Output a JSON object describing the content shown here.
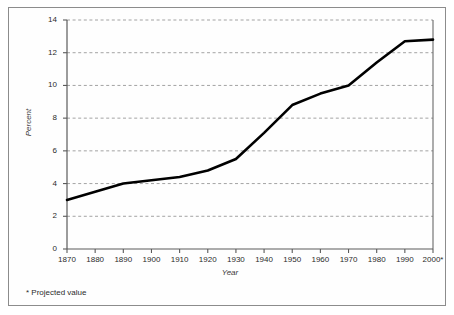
{
  "figure": {
    "footnote": "* Projected value"
  },
  "chart_data": {
    "type": "line",
    "title": "",
    "subtitle": "",
    "xlabel": "Year",
    "ylabel": "Percent",
    "xlim": [
      1870,
      2000
    ],
    "ylim": [
      0,
      14
    ],
    "grid": true,
    "grid_axis": "y",
    "grid_style": "dashed",
    "legend": null,
    "legend_position": "none",
    "x_tick_labels": [
      "1870",
      "1880",
      "1890",
      "1900",
      "1910",
      "1920",
      "1930",
      "1940",
      "1950",
      "1960",
      "1970",
      "1980",
      "1990",
      "2000*"
    ],
    "y_tick_labels": [
      "0",
      "2",
      "4",
      "6",
      "8",
      "10",
      "12",
      "14"
    ],
    "y_ticks": [
      0,
      2,
      4,
      6,
      8,
      10,
      12,
      14
    ],
    "x": [
      1870,
      1880,
      1890,
      1900,
      1910,
      1920,
      1930,
      1940,
      1950,
      1960,
      1970,
      1980,
      1990,
      2000
    ],
    "values": [
      3.0,
      3.5,
      4.0,
      4.2,
      4.4,
      4.8,
      5.5,
      7.1,
      8.8,
      9.5,
      10.0,
      11.4,
      12.7,
      12.8
    ],
    "series": [
      {
        "name": "Percent",
        "values": [
          3.0,
          3.5,
          4.0,
          4.2,
          4.4,
          4.8,
          5.5,
          7.1,
          8.8,
          9.5,
          10.0,
          11.4,
          12.7,
          12.8
        ]
      }
    ],
    "annotations": [
      "* Projected value"
    ],
    "colors": {
      "line": "#000000",
      "grid": "#999999",
      "axis": "#5a5a5a",
      "frame": "#8c8c8c",
      "background": "#ffffff"
    }
  }
}
